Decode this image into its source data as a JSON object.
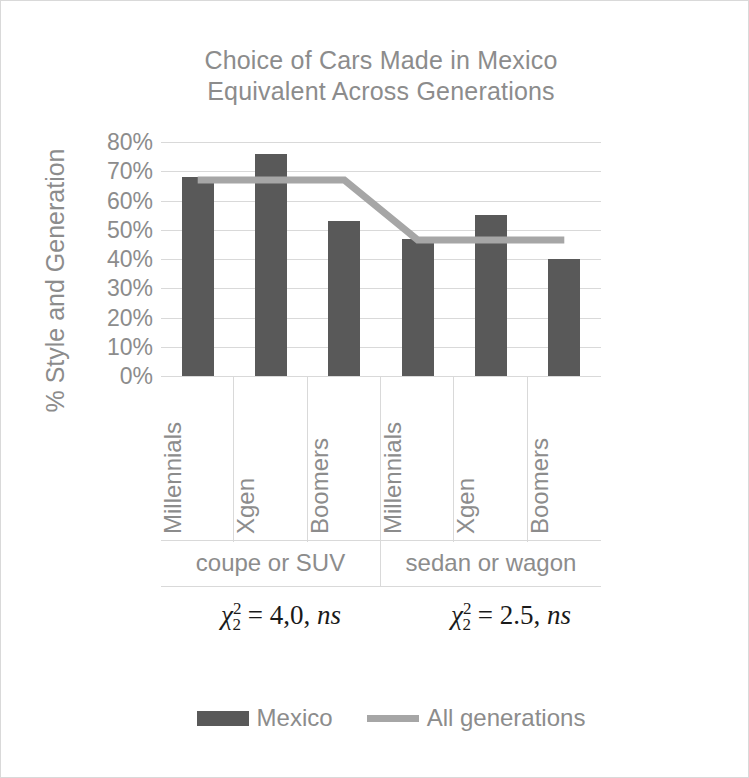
{
  "chart_data": {
    "type": "bar",
    "title": "Choice of Cars Made in Mexico\nEquivalent Across Generations",
    "xlabel": "",
    "ylabel": "% Style and Generation",
    "ylim": [
      0,
      80
    ],
    "ytick_labels": [
      "80%",
      "70%",
      "60%",
      "50%",
      "40%",
      "30%",
      "20%",
      "10%",
      "0%"
    ],
    "ytick_values": [
      80,
      70,
      60,
      50,
      40,
      30,
      20,
      10,
      0
    ],
    "grid": true,
    "legend_position": "bottom",
    "categories": [
      "Millennials",
      "Xgen",
      "Boomers",
      "Millennials",
      "Xgen",
      "Boomers"
    ],
    "groups": [
      {
        "label": "coupe or SUV",
        "categories": [
          "Millennials",
          "Xgen",
          "Boomers"
        ]
      },
      {
        "label": "sedan or wagon",
        "categories": [
          "Millennials",
          "Xgen",
          "Boomers"
        ]
      }
    ],
    "series": [
      {
        "name": "Mexico",
        "type": "bar",
        "color": "#595959",
        "values": [
          68,
          76,
          53,
          47,
          55,
          40
        ]
      },
      {
        "name": "All generations",
        "type": "line",
        "color": "#a6a6a6",
        "values": [
          67,
          67,
          67,
          46.5,
          46.5,
          46.5
        ]
      }
    ],
    "annotations": [
      {
        "id": "coupe-or-suv-chi-square",
        "text": "χ²₂ = 4,0, ns",
        "symbol": "χ",
        "superscript": "2",
        "subscript": "2",
        "equals": "=",
        "value": "4,0",
        "significance": "ns"
      },
      {
        "id": "sedan-or-wagon-chi-square",
        "text": "χ²₂ = 2.5, ns",
        "symbol": "χ",
        "superscript": "2",
        "subscript": "2",
        "equals": "=",
        "value": "2.5",
        "significance": "ns"
      }
    ],
    "legend": [
      {
        "label": "Mexico",
        "marker": "bar-swatch",
        "color": "#595959"
      },
      {
        "label": "All generations",
        "marker": "line-swatch",
        "color": "#a6a6a6"
      }
    ]
  },
  "colors": {
    "bar": "#595959",
    "line": "#a6a6a6",
    "grid": "#d9d9d9",
    "text": "#8c8c8c",
    "annotation_text": "#1a1a1a",
    "background": "#ffffff"
  }
}
